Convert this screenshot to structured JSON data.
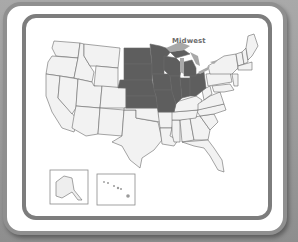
{
  "map": {
    "title": "United States regions map",
    "highlighted_region": {
      "label": "Midwest",
      "states": [
        "North Dakota",
        "South Dakota",
        "Nebraska",
        "Kansas",
        "Minnesota",
        "Iowa",
        "Missouri",
        "Wisconsin",
        "Illinois",
        "Michigan",
        "Indiana",
        "Ohio"
      ]
    },
    "insets": [
      {
        "label": "Alaska"
      },
      {
        "label": "Hawaii"
      }
    ],
    "colors": {
      "highlight": "#5e5e5e",
      "lakes": "#a8a8a8",
      "other_states": "#f2f2f2",
      "state_borders": "#6a6a6a",
      "frame_outer": "#8f8f8f",
      "frame_inner": "#7d7d7d",
      "background": "#ffffff"
    }
  }
}
